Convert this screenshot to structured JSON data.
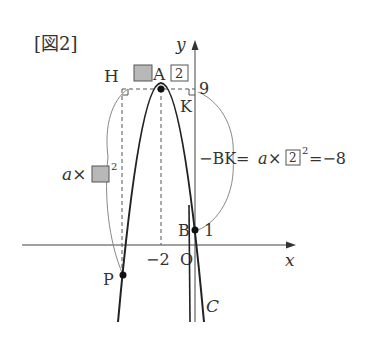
{
  "figure": {
    "title": "[図2]",
    "axes": {
      "x_label": "x",
      "y_label": "y",
      "origin_label": "O"
    },
    "curve_label": "C",
    "points": {
      "A": {
        "label": "A",
        "coords": [
          -2,
          9
        ]
      },
      "B": {
        "label": "B",
        "coords": [
          0,
          1
        ]
      },
      "H": {
        "label": "H"
      },
      "K": {
        "label": "K"
      },
      "P": {
        "label": "P"
      }
    },
    "tick_labels": {
      "y_top": "9",
      "y_B": "1",
      "x_vertex": "−2"
    },
    "boxes": {
      "A_x_box": "2",
      "BK_box": "2"
    },
    "annotations": {
      "left_prefix": "a×",
      "left_superscript": "2",
      "right_prefix": "−BK=",
      "right_a": "a",
      "right_times": "×",
      "right_superscript": "2",
      "right_result": "=−8"
    },
    "colors": {
      "stroke": "#222222",
      "gray_box": "#b8b8b8",
      "thin_line": "#777777"
    }
  }
}
